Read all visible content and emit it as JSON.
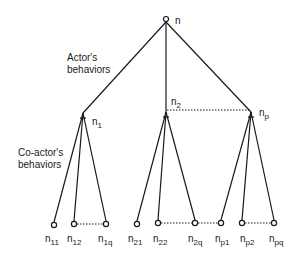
{
  "diagram": {
    "type": "tree",
    "root": {
      "id": "n",
      "label": "n",
      "x": 166,
      "y": 20
    },
    "annotations": {
      "actor_label_line1": "Actor's",
      "actor_label_line2": "behaviors",
      "coactor_label_line1": "Co-actor's",
      "coactor_label_line2": "behaviors"
    },
    "level1": [
      {
        "id": "n1",
        "base": "n",
        "sub": "1",
        "x": 83,
        "y": 113
      },
      {
        "id": "n2",
        "base": "n",
        "sub": "2",
        "x": 166,
        "y": 112
      },
      {
        "id": "np",
        "base": "n",
        "sub": "p",
        "x": 251,
        "y": 112
      }
    ],
    "leaves": [
      {
        "id": "n11",
        "base": "n",
        "sub": "11",
        "parent": "n1",
        "x": 54,
        "y": 225
      },
      {
        "id": "n12",
        "base": "n",
        "sub": "12",
        "parent": "n1",
        "x": 74,
        "y": 224
      },
      {
        "id": "n1q",
        "base": "n",
        "sub": "1q",
        "parent": "n1",
        "x": 106,
        "y": 224
      },
      {
        "id": "n21",
        "base": "n",
        "sub": "21",
        "parent": "n2",
        "x": 137,
        "y": 224
      },
      {
        "id": "n22",
        "base": "n",
        "sub": "22",
        "parent": "n2",
        "x": 158,
        "y": 223
      },
      {
        "id": "n2q",
        "base": "n",
        "sub": "2q",
        "parent": "n2",
        "x": 195,
        "y": 223
      },
      {
        "id": "np1",
        "base": "n",
        "sub": "p1",
        "parent": "np",
        "x": 221,
        "y": 223
      },
      {
        "id": "np2",
        "base": "n",
        "sub": "p2",
        "parent": "np",
        "x": 242,
        "y": 223
      },
      {
        "id": "npq",
        "base": "n",
        "sub": "pq",
        "parent": "np",
        "x": 274,
        "y": 223
      }
    ],
    "dotted_links": [
      [
        "n2",
        "np"
      ],
      [
        "n12",
        "n1q"
      ],
      [
        "n22",
        "n2q"
      ],
      [
        "n2q",
        "np1"
      ],
      [
        "np2",
        "npq"
      ]
    ]
  }
}
